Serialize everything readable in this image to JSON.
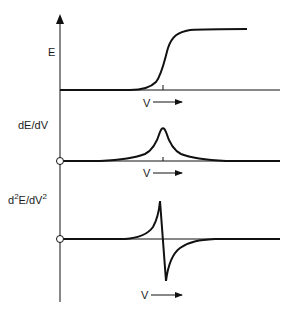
{
  "figure": {
    "panels": [
      {
        "ylabel": "E",
        "xlabel": "V",
        "curve": "step"
      },
      {
        "ylabel": "dE/dV",
        "xlabel": "V",
        "curve": "peak"
      },
      {
        "ylabel_base": "d",
        "ylabel_sup1": "2",
        "ylabel_mid": "E/dV",
        "ylabel_sup2": "2",
        "xlabel": "V",
        "curve": "dispersive"
      }
    ],
    "line_color": "#111111",
    "background": "#ffffff"
  }
}
